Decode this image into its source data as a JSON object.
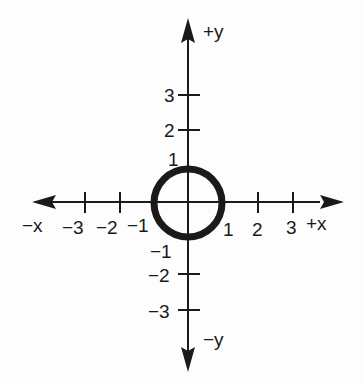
{
  "diagram": {
    "type": "coordinate-plane",
    "axes": {
      "x_positive_label": "+x",
      "x_negative_label": "−x",
      "y_positive_label": "+y",
      "y_negative_label": "−y"
    },
    "x_ticks": [
      {
        "value": -3,
        "label": "−3"
      },
      {
        "value": -2,
        "label": "−2"
      },
      {
        "value": -1,
        "label": "−1"
      },
      {
        "value": 1,
        "label": "1"
      },
      {
        "value": 2,
        "label": "2"
      },
      {
        "value": 3,
        "label": "3"
      }
    ],
    "y_ticks": [
      {
        "value": 3,
        "label": "3"
      },
      {
        "value": 2,
        "label": "2"
      },
      {
        "value": 1,
        "label": "1"
      },
      {
        "value": -1,
        "label": "−1"
      },
      {
        "value": -2,
        "label": "−2"
      },
      {
        "value": -3,
        "label": "−3"
      }
    ],
    "circle": {
      "center": [
        0,
        0
      ],
      "radius": 1
    },
    "colors": {
      "ink": "#1a1a1a",
      "background": "#fdfdfd"
    }
  }
}
